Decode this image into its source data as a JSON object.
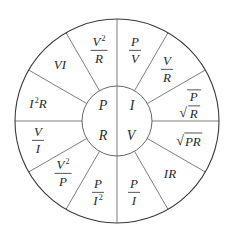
{
  "geometry": {
    "center": [
      117,
      121
    ],
    "outer_radius": 102,
    "inner_radius": 35,
    "sector_count": 12,
    "line_color": "#6f6f6f",
    "circle_color": "#3a3a3a"
  },
  "inner": {
    "top_left": "P",
    "top_right": "I",
    "bottom_left": "R",
    "bottom_right": "V"
  },
  "sectors": {
    "s15": {
      "num": "P",
      "den": "V"
    },
    "s45": {
      "num": "V",
      "den": "R"
    },
    "s75": {
      "sqrt_num": "P",
      "sqrt_den": "R"
    },
    "s105": {
      "sqrt": "PR"
    },
    "s135": {
      "text": "IR"
    },
    "s165": {
      "num": "P",
      "den": "I"
    },
    "s195": {
      "num": "P",
      "den_base": "I",
      "den_exp": "2"
    },
    "s225": {
      "num_base": "V",
      "num_exp": "2",
      "den": "P"
    },
    "s255": {
      "num": "V",
      "den": "I"
    },
    "s285": {
      "base": "I",
      "exp": "2",
      "tail": "R"
    },
    "s315": {
      "text": "VI"
    },
    "s345": {
      "num_base": "V",
      "num_exp": "2",
      "den": "R"
    }
  },
  "symbols": {
    "radical": "√"
  }
}
